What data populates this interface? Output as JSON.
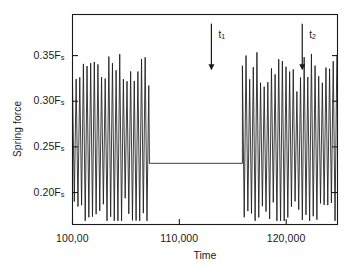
{
  "figure": {
    "background": "#ffffff",
    "line_color": "#1a1a1a",
    "frame_color": "#1a1a1a"
  },
  "axes": {
    "ylabel": "Spring force",
    "xlabel": "Time",
    "y_ticks": [
      {
        "value": 0.35,
        "label_main": "0.35F",
        "label_sub": "s"
      },
      {
        "value": 0.3,
        "label_main": "0.30F",
        "label_sub": "s"
      },
      {
        "value": 0.25,
        "label_main": "0.25F",
        "label_sub": "s"
      },
      {
        "value": 0.2,
        "label_main": "0.20F",
        "label_sub": "s"
      }
    ],
    "x_ticks": [
      {
        "value": 100000,
        "label": "100,00"
      },
      {
        "value": 110000,
        "label": "110,000"
      },
      {
        "value": 120000,
        "label": "120,000"
      }
    ]
  },
  "annotations": [
    {
      "name": "t1",
      "label_main": "t",
      "label_sub": "1",
      "x": 113000,
      "arrow_top": 0.385,
      "arrow_bottom": 0.335
    },
    {
      "name": "t2",
      "label_main": "t",
      "label_sub": "2",
      "x": 121500,
      "arrow_top": 0.385,
      "arrow_bottom": 0.335
    }
  ],
  "chart_data": {
    "type": "line",
    "title": "",
    "xlabel": "Time",
    "ylabel": "Spring force",
    "xlim": [
      100000,
      124800
    ],
    "ylim": [
      0.165,
      0.395
    ],
    "grid": false,
    "legend": null,
    "xticks": [
      100000,
      110000,
      120000
    ],
    "xticklabels": [
      "100,00",
      "110,000",
      "120,000"
    ],
    "yticks": [
      0.2,
      0.25,
      0.3,
      0.35
    ],
    "yticklabels": [
      "0.20Fs",
      "0.30Fs",
      "0.25Fs",
      "0.35Fs"
    ],
    "series": [
      {
        "name": "spring force oscillation",
        "description": "High-frequency oscillation about a mean of ~0.255 Fs with beating amplitude modulation; oscillation is damped out between t1 and t2 where the force is flat at ~0.232 Fs, then resumes.",
        "mean_level": 0.255,
        "flat_level": 0.232,
        "amplitude_max": 0.095,
        "amplitude_min": 0.035,
        "oscillation_period_units": 340,
        "beat_period_units": 2600,
        "segments": [
          {
            "name": "oscillating-left",
            "x_start": 100000,
            "x_end": 107200,
            "mode": "oscillating"
          },
          {
            "name": "flat-middle",
            "x_start": 107200,
            "x_end": 115900,
            "mode": "flat"
          },
          {
            "name": "oscillating-right",
            "x_start": 115900,
            "x_end": 124800,
            "mode": "oscillating"
          }
        ]
      }
    ],
    "t1": 107200,
    "t2": 115900
  }
}
